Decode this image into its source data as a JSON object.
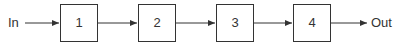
{
  "diagram": {
    "input_label": "In",
    "output_label": "Out",
    "blocks": [
      {
        "label": "1"
      },
      {
        "label": "2"
      },
      {
        "label": "3"
      },
      {
        "label": "4"
      }
    ],
    "colors": {
      "stroke": "#333333",
      "text": "#333333",
      "background": "#ffffff"
    }
  }
}
